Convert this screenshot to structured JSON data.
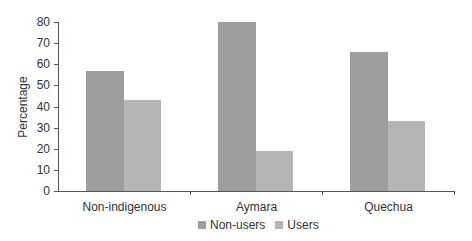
{
  "chart_data": {
    "type": "bar",
    "title": "",
    "xlabel": "",
    "ylabel": "Percentage",
    "ylim": [
      0,
      80
    ],
    "yticks": [
      0,
      10,
      20,
      30,
      40,
      50,
      60,
      70,
      80
    ],
    "categories": [
      "Non-indigenous",
      "Aymara",
      "Quechua"
    ],
    "series": [
      {
        "name": "Non-users",
        "color": "#9e9e9e",
        "values": [
          57,
          80,
          66
        ]
      },
      {
        "name": "Users",
        "color": "#b5b5b5",
        "values": [
          43,
          19,
          33
        ]
      }
    ],
    "grid": false,
    "legend_position": "bottom"
  }
}
